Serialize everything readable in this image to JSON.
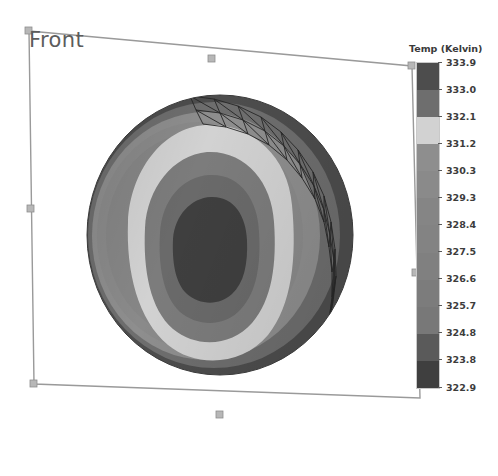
{
  "viewport": {
    "orientation_label": "Front",
    "background_color": "#ffffff",
    "selection_box": {
      "stroke_color": "#9a9a9a",
      "handle_color": "#b7b7b7",
      "corners": [
        [
          29,
          31
        ],
        [
          412,
          66
        ],
        [
          420,
          398
        ],
        [
          34,
          384
        ]
      ],
      "edge_handles": [
        [
          212,
          59
        ],
        [
          416,
          273
        ],
        [
          220,
          415
        ],
        [
          31,
          209
        ]
      ]
    }
  },
  "legend": {
    "title": "Temp (Kelvin)",
    "units": "Kelvin",
    "quantity": "Temp",
    "tick_labels": [
      "333.9",
      "333.0",
      "332.1",
      "331.2",
      "330.3",
      "329.3",
      "328.4",
      "327.5",
      "326.6",
      "325.7",
      "324.8",
      "323.8",
      "322.9"
    ],
    "band_colors": [
      "#4d4d4d",
      "#6e6e6e",
      "#d2d2d2",
      "#8e8e8e",
      "#8a8a8a",
      "#858585",
      "#838383",
      "#808080",
      "#7c7c7c",
      "#787878",
      "#5a5a5a",
      "#3f3f3f"
    ]
  },
  "chart_data": {
    "type": "heatmap",
    "title": "Temp (Kelvin)",
    "subtitle": "",
    "xlabel": "",
    "ylabel": "",
    "colorbar_label": "Temp (Kelvin)",
    "colorbar_ticks": [
      333.9,
      333.0,
      332.1,
      331.2,
      330.3,
      329.3,
      328.4,
      327.5,
      326.6,
      325.7,
      324.8,
      323.8,
      322.9
    ],
    "value_range": [
      322.9,
      333.9
    ],
    "contour_levels": 12,
    "grid": false,
    "legend_position": "right",
    "colormap": "grayscale",
    "view": "Front",
    "geometry": "sphere",
    "mesh_overlay": {
      "visible": true,
      "region": "upper-right-rim",
      "style": "triangular-wireframe",
      "stroke_color": "#2a2a2a"
    },
    "contour_rings": [
      {
        "level_low": 322.9,
        "level_high": 323.8,
        "color": "#3f3f3f",
        "region": "core"
      },
      {
        "level_low": 323.8,
        "level_high": 324.8,
        "color": "#5a5a5a",
        "region": "inner"
      },
      {
        "level_low": 324.8,
        "level_high": 325.7,
        "color": "#787878",
        "region": "inner-mid"
      },
      {
        "level_low": 325.7,
        "level_high": 326.6,
        "color": "#7c7c7c",
        "region": "mid"
      },
      {
        "level_low": 326.6,
        "level_high": 327.5,
        "color": "#808080",
        "region": "mid"
      },
      {
        "level_low": 327.5,
        "level_high": 328.4,
        "color": "#838383",
        "region": "mid-outer"
      },
      {
        "level_low": 328.4,
        "level_high": 329.3,
        "color": "#858585",
        "region": "mid-outer"
      },
      {
        "level_low": 329.3,
        "level_high": 330.3,
        "color": "#8a8a8a",
        "region": "outer"
      },
      {
        "level_low": 330.3,
        "level_high": 331.2,
        "color": "#8e8e8e",
        "region": "outer"
      },
      {
        "level_low": 331.2,
        "level_high": 332.1,
        "color": "#d2d2d2",
        "region": "bright-ring"
      },
      {
        "level_low": 332.1,
        "level_high": 333.0,
        "color": "#6e6e6e",
        "region": "rim"
      },
      {
        "level_low": 333.0,
        "level_high": 333.9,
        "color": "#4d4d4d",
        "region": "edge"
      }
    ]
  }
}
